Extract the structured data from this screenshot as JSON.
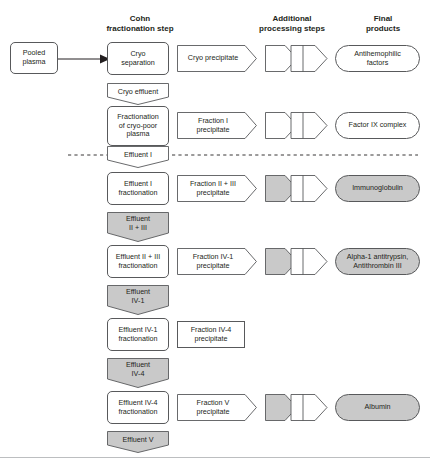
{
  "headers": [
    {
      "id": "cohn",
      "label": "Cohn\nfractionation step"
    },
    {
      "id": "additional",
      "label": "Additional\nprocessing steps"
    },
    {
      "id": "final",
      "label": "Final\nproducts"
    }
  ],
  "source": {
    "label": "Pooled\nplasma"
  },
  "rows": [
    {
      "id": "cryo",
      "step": "Cryo\nseparation",
      "precipitate": "Cryo precipitate",
      "precipitate_shape": "arrow",
      "processing": true,
      "processing_shaded": false,
      "product": "Antihemophilic\nfactors",
      "product_shaded": false,
      "effluent": "Cryo effluent",
      "effluent_shaded": false
    },
    {
      "id": "cryo-poor",
      "step": "Fractionation\nof cryo-poor\nplasma",
      "precipitate": "Fraction I\nprecipitate",
      "precipitate_shape": "arrow",
      "processing": true,
      "processing_shaded": false,
      "product": "Factor IX complex",
      "product_shaded": false,
      "effluent": "Effluent I",
      "effluent_shaded": false
    },
    {
      "id": "effluent-i",
      "step": "Effluent I\nfractionation",
      "precipitate": "Fraction II + III\nprecipitate",
      "precipitate_shape": "arrow",
      "processing": true,
      "processing_shaded": true,
      "product": "Immunoglobulin",
      "product_shaded": true,
      "effluent": "Effluent\nII + III",
      "effluent_shaded": true
    },
    {
      "id": "effluent-ii-iii",
      "step": "Effluent II + III\nfractionation",
      "precipitate": "Fraction IV-1\nprecipitate",
      "precipitate_shape": "arrow",
      "processing": true,
      "processing_shaded": true,
      "product": "Alpha-1 antitrypsin,\nAntithrombin III",
      "product_shaded": true,
      "effluent": "Effluent\nIV-1",
      "effluent_shaded": true
    },
    {
      "id": "effluent-iv-1",
      "step": "Effluent IV-1\nfractionation",
      "precipitate": "Fraction IV-4\nprecipitate",
      "precipitate_shape": "rect",
      "processing": false,
      "processing_shaded": false,
      "product": "",
      "product_shaded": false,
      "effluent": "Effluent\nIV-4",
      "effluent_shaded": true
    },
    {
      "id": "effluent-iv-4",
      "step": "Effluent IV-4\nfractionation",
      "precipitate": "Fraction V\nprecipitate",
      "precipitate_shape": "arrow",
      "processing": true,
      "processing_shaded": true,
      "product": "Albumin",
      "product_shaded": true,
      "effluent": "Effluent V",
      "effluent_shaded": true
    }
  ],
  "divider": {
    "note": "dashed separator at Effluent I"
  },
  "colors": {
    "stroke": "#58595b",
    "shaded_fill": "#c9c9c9",
    "white_fill": "#ffffff",
    "text": "#231f20",
    "rule": "#bcbec0"
  }
}
